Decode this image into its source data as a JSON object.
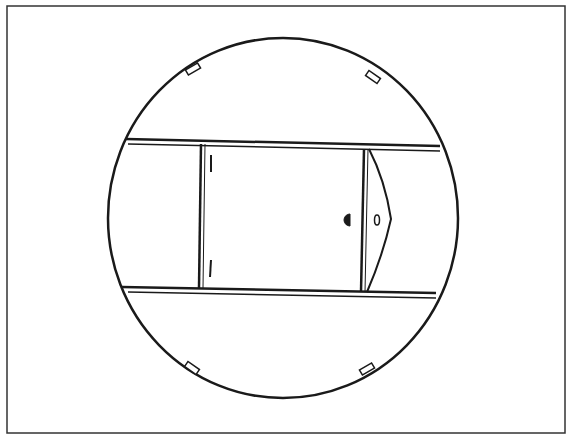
{
  "figure": {
    "stroke_color": "#1a1a1a",
    "background_color": "#ffffff",
    "frame_color": "#333333"
  },
  "elements": {
    "outer_frame": "rectangular border",
    "circle_outline": "large circular outline",
    "tabs": [
      "top-left tab",
      "top-right tab",
      "bottom-left tab",
      "bottom-right tab"
    ],
    "rails": [
      "top horizontal rail",
      "bottom horizontal rail"
    ],
    "panel": "central rectangular panel",
    "panel_marks": [
      "upper tick mark",
      "lower tick mark"
    ],
    "latch": "wedge-shaped latch with oval hole",
    "knob": "half-round knob"
  }
}
